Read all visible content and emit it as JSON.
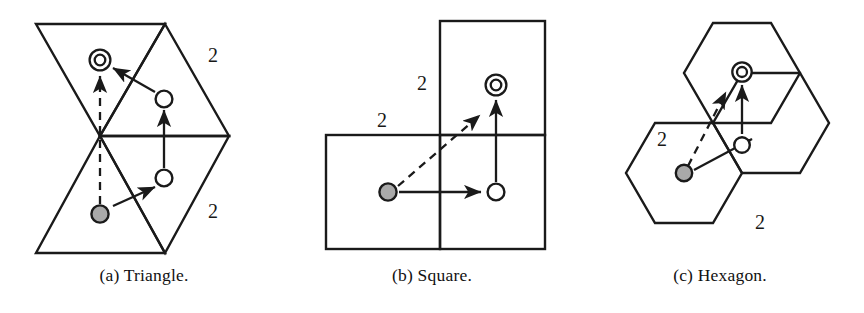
{
  "figure": {
    "background_color": "#ffffff",
    "stroke_color": "#1a1a1a",
    "marker_fill_gray": "#a9a9a9",
    "marker_fill_white": "#ffffff",
    "panels": [
      {
        "id": "triangle",
        "caption": "(a) Triangle.",
        "tiling": "triangle",
        "edge_labels": [
          "2",
          "2"
        ],
        "markers": [
          {
            "role": "target",
            "style": "double-circle"
          },
          {
            "role": "intermediate",
            "style": "open-circle"
          },
          {
            "role": "intermediate",
            "style": "open-circle"
          },
          {
            "role": "source",
            "style": "filled-gray-circle"
          }
        ],
        "arrows": [
          {
            "style": "dashed",
            "from": "source",
            "to": "target"
          },
          {
            "style": "solid",
            "from": "source",
            "to": "intermediate-lower"
          },
          {
            "style": "solid",
            "from": "intermediate-lower",
            "to": "intermediate-upper"
          },
          {
            "style": "solid",
            "from": "intermediate-upper",
            "to": "target"
          }
        ]
      },
      {
        "id": "square",
        "caption": "(b) Square.",
        "tiling": "square",
        "edge_labels": [
          "2",
          "2"
        ],
        "markers": [
          {
            "role": "target",
            "style": "double-circle"
          },
          {
            "role": "intermediate",
            "style": "open-circle"
          },
          {
            "role": "source",
            "style": "filled-gray-circle"
          }
        ],
        "arrows": [
          {
            "style": "dashed",
            "from": "source",
            "to": "target"
          },
          {
            "style": "solid",
            "from": "source",
            "to": "intermediate"
          },
          {
            "style": "solid",
            "from": "intermediate",
            "to": "target"
          }
        ]
      },
      {
        "id": "hexagon",
        "caption": "(c) Hexagon.",
        "tiling": "hexagon",
        "edge_labels": [
          "2",
          "2"
        ],
        "markers": [
          {
            "role": "target",
            "style": "double-circle"
          },
          {
            "role": "intermediate",
            "style": "open-circle"
          },
          {
            "role": "source",
            "style": "filled-gray-circle"
          }
        ],
        "arrows": [
          {
            "style": "dashed",
            "from": "source",
            "to": "target"
          },
          {
            "style": "solid",
            "from": "source",
            "to": "intermediate"
          },
          {
            "style": "solid",
            "from": "intermediate",
            "to": "target"
          }
        ]
      }
    ]
  }
}
